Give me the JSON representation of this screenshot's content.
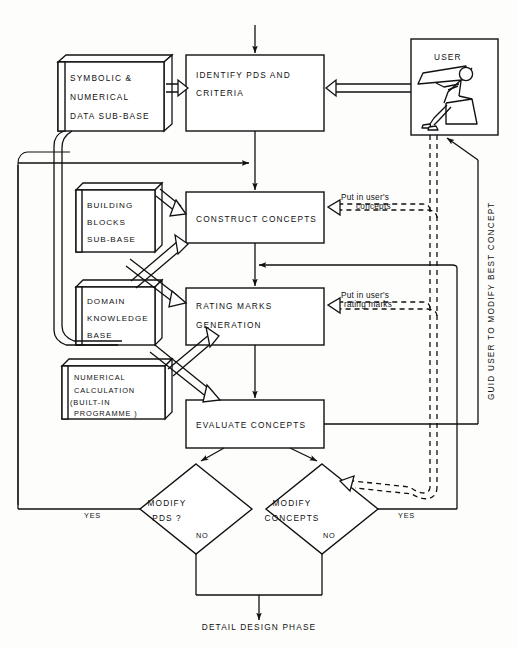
{
  "diagram": {
    "outer_frame": true,
    "stores": [
      {
        "id": "symbolic",
        "lines": [
          "SYMBOLIC  &",
          "NUMERICAL",
          "DATA SUB-BASE"
        ]
      },
      {
        "id": "building",
        "lines": [
          "BUILDING",
          "BLOCKS",
          "SUB-BASE"
        ]
      },
      {
        "id": "domain",
        "lines": [
          "DOMAIN",
          "KNOWLEDGE",
          "BASE"
        ]
      },
      {
        "id": "numerical",
        "lines": [
          "NUMERICAL",
          "CALCULATION",
          "(BUILT-IN",
          " PROGRAMME )"
        ]
      }
    ],
    "processes": [
      {
        "id": "identify",
        "lines": [
          "IDENTIFY   PDS AND",
          "CRITERIA"
        ]
      },
      {
        "id": "construct",
        "lines": [
          "CONSTRUCT   CONCEPTS"
        ]
      },
      {
        "id": "rating",
        "lines": [
          "RATING MARKS",
          "GENERATION"
        ]
      },
      {
        "id": "evaluate",
        "lines": [
          "EVALUATE CONCEPTS"
        ]
      }
    ],
    "user_box": {
      "label": "USER"
    },
    "decisions": [
      {
        "id": "modify-pds",
        "lines": [
          "MODIFY",
          "PDS ?"
        ],
        "yes": "YES",
        "no": "NO"
      },
      {
        "id": "modify-concepts",
        "lines": [
          "MODIFY",
          "CONCEPTS"
        ],
        "yes": "YES",
        "no": "NO"
      }
    ],
    "annotations": [
      {
        "id": "user-concepts",
        "lines": [
          "Put in user's",
          "concepts"
        ]
      },
      {
        "id": "user-rating",
        "lines": [
          "Put in user's",
          "rating marks"
        ]
      }
    ],
    "vertical_label": "GUID USER  TO  MODIFY  BEST CONCEPT",
    "terminal": "DETAIL DESIGN PHASE",
    "colors": {
      "ink": "#111111",
      "paper": "#fdfdfc"
    }
  }
}
